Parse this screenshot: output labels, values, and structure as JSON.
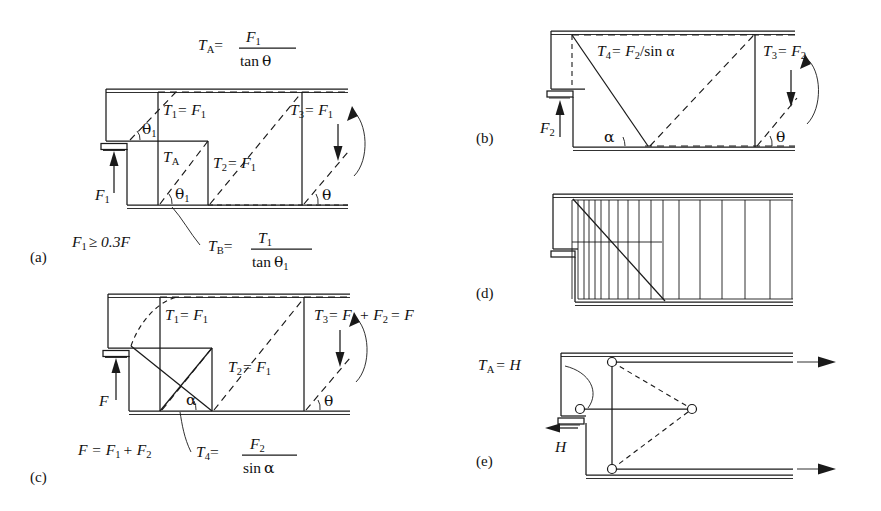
{
  "figure": {
    "background": "#ffffff",
    "line_color": "#1a1a1a"
  },
  "panels": [
    {
      "id": "a",
      "label": "(a)",
      "annotations": {
        "top_formula": {
          "lhs": "T",
          "lhs_sub": "A",
          "eq": "=",
          "num": "F",
          "num_sub": "1",
          "den": "tan",
          "den_sym": "θ"
        },
        "t1": "T",
        "t1_sub": "1",
        "t1_rhs": "= F",
        "t1_rhs_sub": "1",
        "t2": "T",
        "t2_sub": "2",
        "t2_rhs": "= F",
        "t2_rhs_sub": "1",
        "t3": "T",
        "t3_sub": "3",
        "t3_rhs": "= F",
        "t3_rhs_sub": "1",
        "ta": "T",
        "ta_sub": "A",
        "force": "F",
        "force_sub": "1",
        "angle_theta1_upper": "θ",
        "angle_theta1_upper_sub": "1",
        "angle_theta1_lower": "θ",
        "angle_theta1_lower_sub": "1",
        "angle_theta": "θ",
        "condition": "F",
        "condition_sub": "1",
        "condition_rest": "≥ 0.3F",
        "bottom_formula": {
          "lhs": "T",
          "lhs_sub": "B",
          "eq": "=",
          "num": "T",
          "num_sub": "1",
          "den": "tan",
          "den_sym": "θ",
          "den_sub": "1"
        }
      }
    },
    {
      "id": "b",
      "label": "(b)",
      "annotations": {
        "t4": "T",
        "t4_sub": "4",
        "t4_rhs": "= F",
        "t4_rhs_sub": "2",
        "t4_tail": "/sin α",
        "t3": "T",
        "t3_sub": "3",
        "t3_rhs": "= F",
        "t3_rhs_sub": "2",
        "force": "F",
        "force_sub": "2",
        "angle_alpha": "α",
        "angle_theta": "θ"
      }
    },
    {
      "id": "c",
      "label": "(c)",
      "annotations": {
        "t1": "T",
        "t1_sub": "1",
        "t1_rhs": "= F",
        "t1_rhs_sub": "1",
        "t2": "T",
        "t2_sub": "2",
        "t2_rhs": "= F",
        "t2_rhs_sub": "1",
        "t3": "T",
        "t3_sub": "3",
        "t3_rhs": "= F",
        "t3_rhs_sub": "1",
        "t3_tail": "+ F",
        "t3_tail_sub": "2",
        "t3_end": "= F",
        "force": "F",
        "angle_alpha": "α",
        "angle_theta": "θ",
        "sum_formula": "F = F",
        "sum_sub1": "1",
        "sum_mid": "+ F",
        "sum_sub2": "2",
        "t4_formula": {
          "lhs": "T",
          "lhs_sub": "4",
          "eq": "=",
          "num": "F",
          "num_sub": "2",
          "den": "sin",
          "den_sym": "α"
        }
      }
    },
    {
      "id": "d",
      "label": "(d)",
      "annotations": {},
      "hatch_count": 19
    },
    {
      "id": "e",
      "label": "(e)",
      "annotations": {
        "ta": "T",
        "ta_sub": "A",
        "ta_rhs": "= H",
        "force": "H"
      }
    }
  ]
}
